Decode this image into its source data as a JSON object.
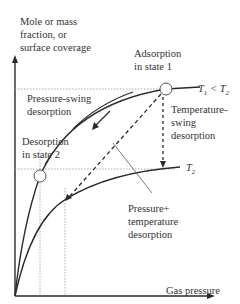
{
  "diagram": {
    "type": "adsorption isotherms / swing desorption schematic",
    "y_axis_label": "Mole or mass\nfraction, or\nsurface coverage",
    "x_axis_label": "Gas pressure",
    "curves": [
      {
        "id": "T1",
        "label_main": "T",
        "label_sub": "1",
        "label_rest": " < T",
        "label_sub2": "2"
      },
      {
        "id": "T2",
        "label_main": "T",
        "label_sub": "2"
      }
    ],
    "annotations": {
      "adsorption_state1": "Adsorption\nin state 1",
      "desorption_state2": "Desorption\nin state 2",
      "pressure_swing": "Pressure-swing\ndesorption",
      "temperature_swing": "Temperature-\nswing\ndesorption",
      "pressure_temperature": "Pressure+\ntemperature\ndesorption"
    },
    "colors": {
      "line": "#2a2a2a",
      "dotted": "#888888",
      "background": "#ffffff"
    }
  }
}
